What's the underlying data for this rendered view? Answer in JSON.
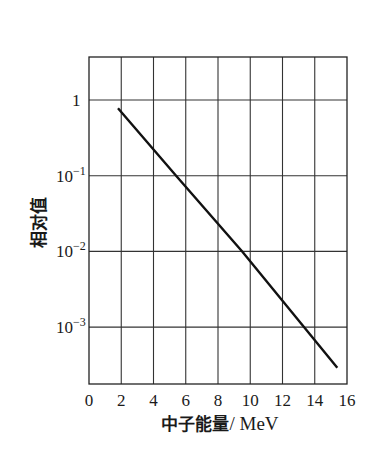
{
  "chart_data": {
    "type": "line",
    "title": "",
    "xlabel": "中子能量/ MeV",
    "xlabel_cn": "中子能量",
    "xlabel_unit": "/ MeV",
    "ylabel": "相对值",
    "x_ticks": [
      0,
      2,
      4,
      6,
      8,
      10,
      12,
      14,
      16
    ],
    "x_tick_labels": [
      "0",
      "2",
      "4",
      "6",
      "8",
      "10",
      "12",
      "14",
      "16"
    ],
    "y_scale": "log",
    "y_ticks": [
      1,
      0.1,
      0.01,
      0.001
    ],
    "y_tick_labels": [
      {
        "base": "1",
        "exp": ""
      },
      {
        "base": "10",
        "exp": "−1"
      },
      {
        "base": "10",
        "exp": "−2"
      },
      {
        "base": "10",
        "exp": "−3"
      }
    ],
    "xlim": [
      0,
      16
    ],
    "ylim": [
      0.00018,
      3.7
    ],
    "grid": true,
    "legend": null,
    "series": [
      {
        "name": "相对值",
        "x": [
          1.8,
          5.4,
          9.5,
          15.4
        ],
        "y": [
          0.78,
          0.1,
          0.01,
          0.00029
        ]
      }
    ],
    "colors": {
      "line": "#111111",
      "grid": "#333333",
      "background": "#ffffff"
    }
  }
}
